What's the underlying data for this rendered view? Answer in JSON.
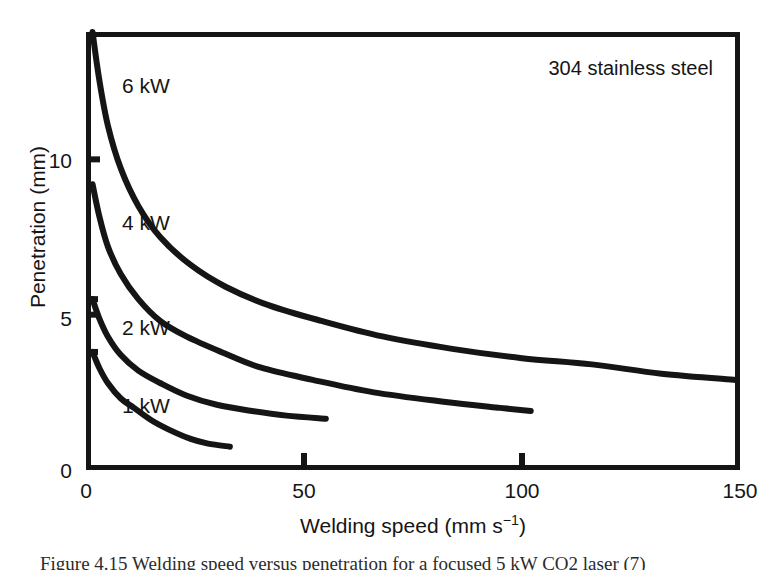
{
  "figure": {
    "annotation": "304 stainless steel",
    "caption_clipped": "Figure 4.15  Welding speed versus penetration for a focused 5 kW CO2 laser (7)"
  },
  "axes": {
    "x": {
      "title_main": "Welding speed (mm s",
      "title_sup": "−1",
      "title_tail": ")",
      "ticks": [
        {
          "value": 0,
          "label": "0"
        },
        {
          "value": 50,
          "label": "50"
        },
        {
          "value": 100,
          "label": "100"
        },
        {
          "value": 150,
          "label": "150"
        }
      ]
    },
    "y": {
      "title": "Penetration (mm)",
      "ticks": [
        {
          "value": 0,
          "label": "0"
        },
        {
          "value": 5,
          "label": "5"
        },
        {
          "value": 10,
          "label": "10"
        }
      ]
    }
  },
  "chart_data": {
    "type": "line",
    "title": "",
    "xlabel": "Welding speed (mm s−1)",
    "ylabel": "Penetration (mm)",
    "xlim": [
      0,
      150
    ],
    "ylim": [
      0,
      14.1
    ],
    "grid": false,
    "legend": "inline-curve-labels",
    "annotations": [
      "304 stainless steel"
    ],
    "series": [
      {
        "name": "6 kW",
        "label": "6 kW",
        "color": "#151515",
        "points": [
          {
            "x": 1.5,
            "y": 14.1
          },
          {
            "x": 3,
            "y": 12.6
          },
          {
            "x": 5,
            "y": 11.1
          },
          {
            "x": 8,
            "y": 9.7
          },
          {
            "x": 12,
            "y": 8.5
          },
          {
            "x": 17,
            "y": 7.5
          },
          {
            "x": 24,
            "y": 6.6
          },
          {
            "x": 32,
            "y": 5.9
          },
          {
            "x": 42,
            "y": 5.3
          },
          {
            "x": 54,
            "y": 4.8
          },
          {
            "x": 68,
            "y": 4.3
          },
          {
            "x": 84,
            "y": 3.9
          },
          {
            "x": 100,
            "y": 3.6
          },
          {
            "x": 116,
            "y": 3.4
          },
          {
            "x": 132,
            "y": 3.1
          },
          {
            "x": 149,
            "y": 2.9
          }
        ]
      },
      {
        "name": "4 kW",
        "label": "4 kW",
        "color": "#151515",
        "points": [
          {
            "x": 1.5,
            "y": 9.2
          },
          {
            "x": 3,
            "y": 8.2
          },
          {
            "x": 5,
            "y": 7.2
          },
          {
            "x": 8,
            "y": 6.3
          },
          {
            "x": 12,
            "y": 5.5
          },
          {
            "x": 17,
            "y": 4.8
          },
          {
            "x": 23,
            "y": 4.3
          },
          {
            "x": 31,
            "y": 3.8
          },
          {
            "x": 40,
            "y": 3.3
          },
          {
            "x": 52,
            "y": 2.9
          },
          {
            "x": 66,
            "y": 2.5
          },
          {
            "x": 82,
            "y": 2.2
          },
          {
            "x": 95,
            "y": 2.0
          },
          {
            "x": 102,
            "y": 1.9
          }
        ]
      },
      {
        "name": "2 kW",
        "label": "2 kW",
        "color": "#151515",
        "points": [
          {
            "x": 1.5,
            "y": 5.5
          },
          {
            "x": 3,
            "y": 4.9
          },
          {
            "x": 5,
            "y": 4.3
          },
          {
            "x": 8,
            "y": 3.7
          },
          {
            "x": 12,
            "y": 3.2
          },
          {
            "x": 17,
            "y": 2.8
          },
          {
            "x": 23,
            "y": 2.4
          },
          {
            "x": 30,
            "y": 2.1
          },
          {
            "x": 38,
            "y": 1.9
          },
          {
            "x": 46,
            "y": 1.75
          },
          {
            "x": 55,
            "y": 1.65
          }
        ]
      },
      {
        "name": "1 kW",
        "label": "1 kW",
        "color": "#151515",
        "points": [
          {
            "x": 1.5,
            "y": 3.8
          },
          {
            "x": 3,
            "y": 3.3
          },
          {
            "x": 5,
            "y": 2.8
          },
          {
            "x": 8,
            "y": 2.3
          },
          {
            "x": 11,
            "y": 2.0
          },
          {
            "x": 15,
            "y": 1.6
          },
          {
            "x": 19,
            "y": 1.3
          },
          {
            "x": 24,
            "y": 1.0
          },
          {
            "x": 28,
            "y": 0.85
          },
          {
            "x": 33,
            "y": 0.75
          }
        ]
      }
    ]
  }
}
